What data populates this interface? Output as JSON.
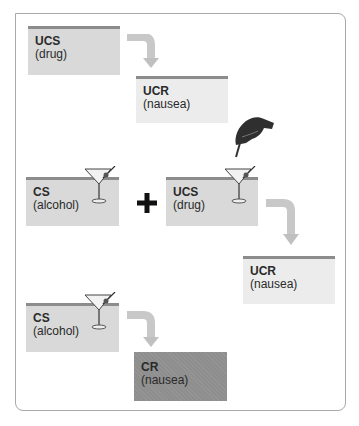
{
  "diagram": {
    "title": "",
    "stages": [
      {
        "name": "before-conditioning",
        "stimulus": {
          "label": "UCS",
          "sub": "(drug)"
        },
        "response": {
          "label": "UCR",
          "sub": "(nausea)"
        }
      },
      {
        "name": "during-conditioning",
        "stimulus_a": {
          "label": "CS",
          "sub": "(alcohol)"
        },
        "operator": "+",
        "stimulus_b": {
          "label": "UCS",
          "sub": "(drug)"
        },
        "response": {
          "label": "UCR",
          "sub": "(nausea)"
        }
      },
      {
        "name": "after-conditioning",
        "stimulus": {
          "label": "CS",
          "sub": "(alcohol)"
        },
        "response": {
          "label": "CR",
          "sub": "(nausea)"
        }
      }
    ],
    "colors": {
      "box_mid": "#d9d9d9",
      "box_light": "#ececec",
      "box_dark": "#8e8e8e",
      "box_top_border": "#8c8c8c",
      "arrow": "#c8c8c8",
      "frame": "#a9a9a9"
    }
  }
}
